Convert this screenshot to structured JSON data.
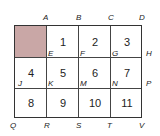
{
  "diagram": {
    "shaded_color": "#c9a7a6",
    "columns": 4,
    "rows": 3,
    "cells": [
      {
        "row": 0,
        "col": 0,
        "label": "",
        "shaded": true
      },
      {
        "row": 0,
        "col": 1,
        "label": "1"
      },
      {
        "row": 0,
        "col": 2,
        "label": "2"
      },
      {
        "row": 0,
        "col": 3,
        "label": "3"
      },
      {
        "row": 1,
        "col": 0,
        "label": "4"
      },
      {
        "row": 1,
        "col": 1,
        "label": "5"
      },
      {
        "row": 1,
        "col": 2,
        "label": "6"
      },
      {
        "row": 1,
        "col": 3,
        "label": "7"
      },
      {
        "row": 2,
        "col": 0,
        "label": "8"
      },
      {
        "row": 2,
        "col": 1,
        "label": "9"
      },
      {
        "row": 2,
        "col": 2,
        "label": "10"
      },
      {
        "row": 2,
        "col": 3,
        "label": "11"
      }
    ],
    "points": {
      "top": [
        "A",
        "B",
        "C",
        "D"
      ],
      "row1": [
        "E",
        "F",
        "G",
        "H"
      ],
      "row2": [
        "J",
        "K",
        "M",
        "N",
        "P"
      ],
      "bottom": [
        "Q",
        "R",
        "S",
        "T",
        "V"
      ]
    }
  }
}
